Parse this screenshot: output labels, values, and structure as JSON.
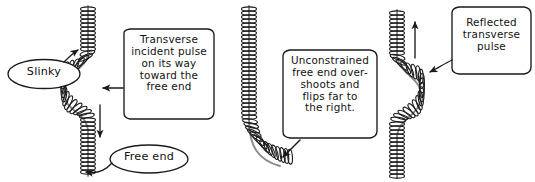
{
  "figure": {
    "background_color": "#ffffff",
    "ink_color": "#1a1a1a",
    "width": 535,
    "height": 182
  },
  "panels": [
    {
      "id": "panel-incident",
      "order": 1,
      "description": "Vertical slinky with a transverse S-shaped pulse travelling downward",
      "direction_arrow": "down"
    },
    {
      "id": "panel-overshoot",
      "order": 2,
      "description": "Straight slinky whose unconstrained free end has whipped over to the right",
      "direction_arrow": "none"
    },
    {
      "id": "panel-reflected",
      "order": 3,
      "description": "Vertical slinky with the reflected S-shaped pulse travelling upward",
      "direction_arrow": "up"
    }
  ],
  "callouts": [
    {
      "id": "callout-slinky",
      "shape": "oval",
      "text": "Slinky",
      "points_to": "slinky-coil-panel-1"
    },
    {
      "id": "callout-incident-pulse",
      "shape": "rounded-box",
      "text": "Transverse\nincident pulse\non its way\ntoward the\nfree end",
      "points_to": "pulse-panel-1"
    },
    {
      "id": "callout-free-end",
      "shape": "oval",
      "text": "Free end",
      "points_to": "free-end-panel-1"
    },
    {
      "id": "callout-overshoot",
      "shape": "rounded-box",
      "text": "Unconstrained\nfree end over-\nshoots and\nflips far to\nthe right.",
      "points_to": "free-end-panel-2"
    },
    {
      "id": "callout-reflected-pulse",
      "shape": "rounded-box",
      "text": "Reflected\ntransverse\npulse",
      "points_to": "pulse-panel-3"
    }
  ],
  "arrows": [
    {
      "id": "arrow-pulse-down",
      "name": "incident-travel-arrow",
      "direction": "down"
    },
    {
      "id": "arrow-pulse-up",
      "name": "reflected-travel-arrow",
      "direction": "up"
    },
    {
      "id": "arrow-slinky-pointer",
      "name": "slinky-leader-arrow",
      "direction": "up-right"
    },
    {
      "id": "arrow-free-end-pointer",
      "name": "free-end-leader-arrow",
      "direction": "left"
    },
    {
      "id": "arrow-incident-pointer",
      "name": "incident-callout-leader",
      "direction": "left"
    },
    {
      "id": "arrow-overshoot-pointer",
      "name": "overshoot-callout-leader",
      "direction": "down-left"
    },
    {
      "id": "arrow-reflected-pointer",
      "name": "reflected-callout-leader",
      "direction": "down-left"
    }
  ]
}
